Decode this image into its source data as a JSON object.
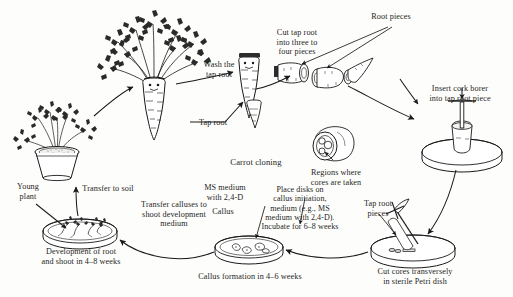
{
  "figure": {
    "title": "Carrot cloning",
    "style": "black-and-white-line-drawing"
  },
  "labels": {
    "title": "Carrot cloning",
    "wash_tap_root": "Wash the\ntap root",
    "tap_root": "Tap root",
    "cut_tap_root": "Cut tap root\ninto three to\nfour pieces",
    "root_pieces": "Root pieces",
    "insert_cork_borer": "Insert cork borer\ninto tap root piece",
    "regions_where_cores": "Regions where\ncores are taken",
    "tap_root_pieces": "Tap root\npieces",
    "cut_cores": "Cut cores transversely\nin sterile Petri dish",
    "place_disks": "Place disks on\ncallus initiation,\nmedium (e.g., MS\nmedium with 2,4-D).\nIncubate for 6–8 weeks",
    "ms_medium": "MS medium\nwith 2,4-D",
    "callus": "Callus",
    "callus_formation": "Callus formation in 4–6 weeks",
    "transfer_calluses": "Transfer calluses to\nshoot development\nmedium",
    "development_root_shoot": "Development of root\nand shoot in 4–8 weeks",
    "transfer_to_soil": "Transfer to soil",
    "young_plant": "Young\nplant"
  },
  "steps": [
    {
      "id": 1,
      "name": "young-plant-in-pot",
      "label": "Young plant"
    },
    {
      "id": 2,
      "name": "mature-carrot-plant",
      "label": "Tap root"
    },
    {
      "id": 3,
      "name": "washed-tap-root",
      "label": "Wash the tap root"
    },
    {
      "id": 4,
      "name": "cut-root-pieces",
      "label": "Root pieces"
    },
    {
      "id": 5,
      "name": "cork-borer-insertion",
      "label": "Insert cork borer into tap root piece"
    },
    {
      "id": 6,
      "name": "core-cross-section",
      "label": "Regions where cores are taken"
    },
    {
      "id": 7,
      "name": "cut-cores-petri-dish",
      "label": "Cut cores transversely in sterile Petri dish"
    },
    {
      "id": 8,
      "name": "callus-initiation-dish",
      "label": "Place disks on callus initiation medium"
    },
    {
      "id": 9,
      "name": "callus-dish",
      "label": "Callus formation in 4–6 weeks"
    },
    {
      "id": 10,
      "name": "shoot-development-dish",
      "label": "Development of root and shoot in 4–8 weeks"
    },
    {
      "id": 11,
      "name": "potted-plantlet",
      "label": "Transfer to soil"
    }
  ],
  "durations": {
    "callus_initiation": "6–8 weeks",
    "callus_formation": "4–6 weeks",
    "root_and_shoot": "4–8 weeks"
  },
  "chemicals": {
    "medium": "MS medium",
    "hormone": "2,4-D"
  },
  "colors": {
    "ink": "#1a1a1a",
    "paper": "#fdfdfb",
    "fill_light": "#f2f2f0",
    "fill_mid": "#d8d8d4"
  }
}
